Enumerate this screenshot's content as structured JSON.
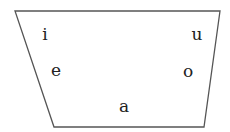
{
  "diagram": {
    "type": "vowel-trapezoid",
    "outline_color": "#555555",
    "text_color": "#222222",
    "vowels": {
      "i": "i",
      "u": "u",
      "e": "e",
      "o": "o",
      "a": "a"
    }
  }
}
